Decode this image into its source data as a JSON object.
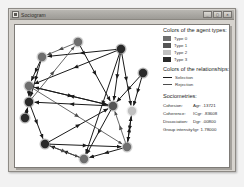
{
  "window": {
    "title": "Sociogram",
    "icon": "app-window-icon",
    "buttons": [
      {
        "name": "minimize",
        "glyph": "_"
      },
      {
        "name": "maximize",
        "glyph": "□"
      },
      {
        "name": "close",
        "glyph": "×"
      }
    ]
  },
  "legend": {
    "agent_types_heading": "Colors of the agent types:",
    "agent_types": [
      {
        "label": "Type 0",
        "color": "#6e6e6e"
      },
      {
        "label": "Type 1",
        "color": "#555555"
      },
      {
        "label": "Type 2",
        "color": "#c0c0c0"
      },
      {
        "label": "Type 3",
        "color": "#2a2a2a"
      }
    ],
    "relationships_heading": "Colors of the relationships:",
    "relationships": [
      {
        "label": "Selection",
        "color": "#1a1a1a"
      },
      {
        "label": "Rejection",
        "color": "#4d4d4d"
      }
    ],
    "sociometrics_heading": "Sociometries:",
    "sociometrics": [
      {
        "label": "Cohesion:",
        "value": "Agr: .13721"
      },
      {
        "label": "Coherence:",
        "value": "ICgr: .83608"
      },
      {
        "label": "Dissociation:",
        "value": "Dgr: .00800"
      },
      {
        "label": "Group intensity:",
        "value": "Igr: 1.78000"
      }
    ]
  },
  "chart_data": {
    "type": "scatter",
    "title": "Sociogram",
    "xlabel": "",
    "ylabel": "",
    "node_radius": 4.2,
    "nodes": [
      {
        "id": "n0",
        "x": 63,
        "y": 17,
        "type": "Type 0",
        "color": "#6e6e6e"
      },
      {
        "id": "n1",
        "x": 106,
        "y": 24,
        "type": "Type 3",
        "color": "#2a2a2a"
      },
      {
        "id": "n2",
        "x": 128,
        "y": 48,
        "type": "Type 3",
        "color": "#2a2a2a"
      },
      {
        "id": "n3",
        "x": 27,
        "y": 32,
        "type": "Type 0",
        "color": "#6e6e6e"
      },
      {
        "id": "n4",
        "x": 14,
        "y": 61,
        "type": "Type 0",
        "color": "#6e6e6e"
      },
      {
        "id": "n5",
        "x": 14,
        "y": 77,
        "type": "Type 3",
        "color": "#2a2a2a"
      },
      {
        "id": "n6",
        "x": 10,
        "y": 93,
        "type": "Type 3",
        "color": "#2a2a2a"
      },
      {
        "id": "n7",
        "x": 30,
        "y": 119,
        "type": "Type 3",
        "color": "#2a2a2a"
      },
      {
        "id": "n8",
        "x": 69,
        "y": 134,
        "type": "Type 0",
        "color": "#6e6e6e"
      },
      {
        "id": "n9",
        "x": 112,
        "y": 122,
        "type": "Type 0",
        "color": "#6e6e6e"
      },
      {
        "id": "n10",
        "x": 117,
        "y": 86,
        "type": "Type 2",
        "color": "#c0c0c0"
      },
      {
        "id": "n11",
        "x": 98,
        "y": 81,
        "type": "Type 1",
        "color": "#555555"
      }
    ],
    "edges": [
      {
        "from": "n1",
        "to": "n3",
        "kind": "Selection"
      },
      {
        "from": "n1",
        "to": "n4",
        "kind": "Selection"
      },
      {
        "from": "n0",
        "to": "n11",
        "kind": "Selection"
      },
      {
        "from": "n1",
        "to": "n11",
        "kind": "Selection"
      },
      {
        "from": "n1",
        "to": "n8",
        "kind": "Selection"
      },
      {
        "from": "n1",
        "to": "n10",
        "kind": "Selection"
      },
      {
        "from": "n2",
        "to": "n10",
        "kind": "Selection"
      },
      {
        "from": "n2",
        "to": "n11",
        "kind": "Selection"
      },
      {
        "from": "n3",
        "to": "n4",
        "kind": "Selection"
      },
      {
        "from": "n3",
        "to": "n5",
        "kind": "Selection"
      },
      {
        "from": "n4",
        "to": "n11",
        "kind": "Selection"
      },
      {
        "from": "n4",
        "to": "n5",
        "kind": "Selection"
      },
      {
        "from": "n5",
        "to": "n7",
        "kind": "Selection"
      },
      {
        "from": "n6",
        "to": "n5",
        "kind": "Selection"
      },
      {
        "from": "n7",
        "to": "n9",
        "kind": "Selection"
      },
      {
        "from": "n7",
        "to": "n11",
        "kind": "Selection"
      },
      {
        "from": "n8",
        "to": "n7",
        "kind": "Selection"
      },
      {
        "from": "n9",
        "to": "n8",
        "kind": "Selection"
      },
      {
        "from": "n9",
        "to": "n10",
        "kind": "Selection"
      },
      {
        "from": "n10",
        "to": "n9",
        "kind": "Selection"
      },
      {
        "from": "n11",
        "to": "n4",
        "kind": "Selection"
      },
      {
        "from": "n11",
        "to": "n8",
        "kind": "Selection"
      },
      {
        "from": "n11",
        "to": "n5",
        "kind": "Selection"
      },
      {
        "from": "n0",
        "to": "n3",
        "kind": "Rejection"
      },
      {
        "from": "n5",
        "to": "n0",
        "kind": "Rejection"
      },
      {
        "from": "n4",
        "to": "n9",
        "kind": "Rejection"
      },
      {
        "from": "n7",
        "to": "n8",
        "kind": "Rejection"
      },
      {
        "from": "n9",
        "to": "n11",
        "kind": "Rejection"
      }
    ]
  }
}
